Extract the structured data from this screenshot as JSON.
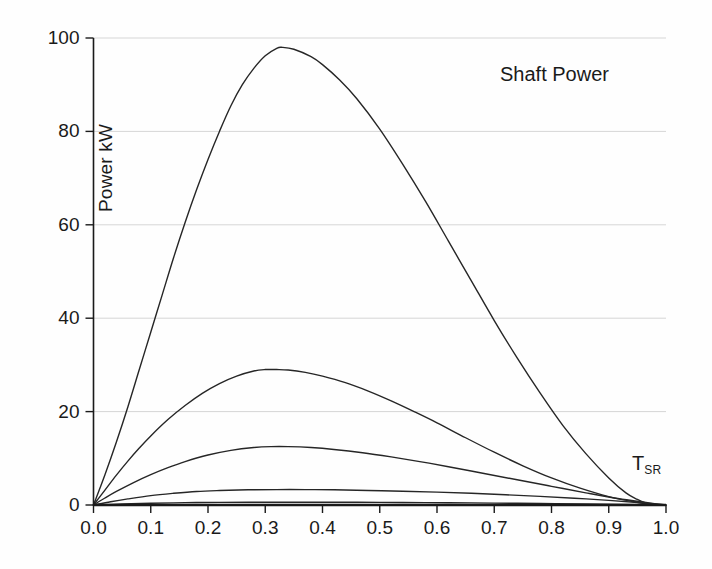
{
  "chart_data": {
    "type": "line",
    "title": "Shaft Power",
    "xlabel_main": "T",
    "xlabel_sub": "SR",
    "ylabel": "Power kW",
    "xlim": [
      0.0,
      1.0
    ],
    "ylim": [
      0,
      100
    ],
    "grid": true,
    "grid_axis": "y",
    "legend": "none",
    "xticks": [
      "0.0",
      "0.1",
      "0.2",
      "0.3",
      "0.4",
      "0.5",
      "0.6",
      "0.7",
      "0.8",
      "0.9",
      "1.0"
    ],
    "xtick_values": [
      0.0,
      0.1,
      0.2,
      0.3,
      0.4,
      0.5,
      0.6,
      0.7,
      0.8,
      0.9,
      1.0
    ],
    "yticks": [
      "0",
      "20",
      "40",
      "60",
      "80",
      "100"
    ],
    "ytick_values": [
      0,
      20,
      40,
      60,
      80,
      100
    ],
    "line_color": "#262626",
    "grid_color": "#d6d6d6",
    "axis_color": "#1a1a1a",
    "background": "#fefefe",
    "series": [
      {
        "name": "curve-1",
        "peak_x": 0.33,
        "peak_y": 98,
        "x": [
          0.0,
          0.02,
          0.04,
          0.06,
          0.08,
          0.1,
          0.12,
          0.14,
          0.16,
          0.18,
          0.2,
          0.22,
          0.24,
          0.26,
          0.28,
          0.3,
          0.32,
          0.33,
          0.35,
          0.38,
          0.4,
          0.43,
          0.46,
          0.5,
          0.54,
          0.58,
          0.62,
          0.66,
          0.7,
          0.74,
          0.78,
          0.82,
          0.86,
          0.9,
          0.93,
          0.95,
          0.965,
          0.975
        ],
        "y": [
          0.0,
          6.5,
          13.5,
          21.0,
          29.0,
          37.0,
          45.0,
          53.0,
          60.5,
          67.5,
          74.0,
          80.0,
          85.5,
          90.0,
          93.5,
          96.2,
          97.8,
          98.0,
          97.6,
          96.0,
          94.3,
          91.0,
          87.0,
          80.5,
          73.0,
          65.0,
          56.5,
          48.0,
          39.5,
          31.5,
          24.0,
          17.0,
          11.0,
          5.8,
          2.6,
          1.2,
          0.4,
          0.0
        ]
      },
      {
        "name": "curve-2",
        "peak_x": 0.32,
        "peak_y": 29,
        "x": [
          0.0,
          0.02,
          0.04,
          0.06,
          0.08,
          0.1,
          0.13,
          0.16,
          0.19,
          0.22,
          0.25,
          0.28,
          0.3,
          0.32,
          0.34,
          0.37,
          0.4,
          0.44,
          0.48,
          0.52,
          0.56,
          0.6,
          0.65,
          0.7,
          0.75,
          0.8,
          0.85,
          0.9,
          0.94,
          0.97,
          0.99
        ],
        "y": [
          0.0,
          3.2,
          6.4,
          9.4,
          12.2,
          14.8,
          18.3,
          21.3,
          23.9,
          26.0,
          27.6,
          28.7,
          29.0,
          29.0,
          28.9,
          28.4,
          27.6,
          26.2,
          24.4,
          22.3,
          20.0,
          17.6,
          14.4,
          11.3,
          8.4,
          5.8,
          3.6,
          1.8,
          0.8,
          0.2,
          0.0
        ]
      },
      {
        "name": "curve-3",
        "peak_x": 0.31,
        "peak_y": 12.5,
        "x": [
          0.0,
          0.02,
          0.04,
          0.07,
          0.1,
          0.13,
          0.16,
          0.2,
          0.24,
          0.28,
          0.31,
          0.34,
          0.38,
          0.42,
          0.47,
          0.52,
          0.57,
          0.62,
          0.68,
          0.74,
          0.8,
          0.86,
          0.91,
          0.95,
          0.98,
          1.0
        ],
        "y": [
          0.0,
          1.5,
          2.9,
          4.8,
          6.5,
          8.0,
          9.3,
          10.7,
          11.7,
          12.3,
          12.5,
          12.5,
          12.3,
          11.9,
          11.2,
          10.3,
          9.3,
          8.2,
          6.8,
          5.4,
          4.0,
          2.6,
          1.5,
          0.8,
          0.3,
          0.0
        ]
      },
      {
        "name": "curve-4",
        "peak_x": 0.35,
        "peak_y": 3.3,
        "x": [
          0.0,
          0.03,
          0.06,
          0.1,
          0.14,
          0.18,
          0.22,
          0.27,
          0.32,
          0.37,
          0.42,
          0.48,
          0.54,
          0.6,
          0.66,
          0.72,
          0.78,
          0.84,
          0.9,
          0.95,
          0.98,
          1.0
        ],
        "y": [
          0.0,
          0.7,
          1.3,
          2.0,
          2.5,
          2.9,
          3.1,
          3.25,
          3.3,
          3.3,
          3.25,
          3.1,
          2.95,
          2.75,
          2.5,
          2.2,
          1.85,
          1.45,
          1.0,
          0.55,
          0.2,
          0.0
        ]
      },
      {
        "name": "curve-5",
        "peak_x": 0.38,
        "peak_y": 0.6,
        "x": [
          0.0,
          0.05,
          0.1,
          0.16,
          0.22,
          0.3,
          0.38,
          0.46,
          0.54,
          0.62,
          0.7,
          0.78,
          0.86,
          0.93,
          0.98,
          1.0
        ],
        "y": [
          0.0,
          0.22,
          0.38,
          0.5,
          0.56,
          0.6,
          0.6,
          0.58,
          0.54,
          0.48,
          0.41,
          0.33,
          0.23,
          0.12,
          0.03,
          0.0
        ]
      }
    ]
  }
}
